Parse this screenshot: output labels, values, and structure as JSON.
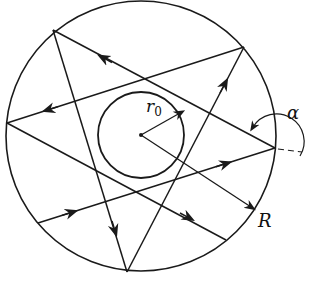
{
  "diagram": {
    "type": "reflection-paths-in-circle",
    "stroke_color": "#1a1a1a",
    "background": "#ffffff",
    "outer_circle": {
      "cx": 141,
      "cy": 136,
      "r": 135
    },
    "inner_circle": {
      "cx": 141,
      "cy": 135,
      "r": 43
    },
    "labels": {
      "inner_radius": "r",
      "inner_radius_sub": "0",
      "outer_radius": "R",
      "angle": "α"
    }
  }
}
